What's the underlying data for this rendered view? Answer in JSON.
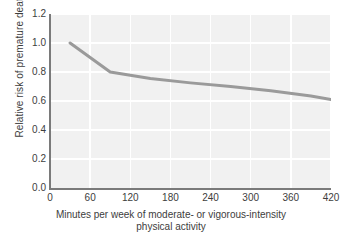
{
  "chart_data": {
    "type": "line",
    "title": "",
    "xlabel": "Minutes per week of moderate- or vigorous-intensity physical activity",
    "xlabel_line1": "Minutes per week of moderate- or vigorous-intensity",
    "xlabel_line2": "physical activity",
    "ylabel": "Relative risk of premature death",
    "xlim": [
      0,
      420
    ],
    "ylim": [
      0.0,
      1.2
    ],
    "xticks": [
      0,
      60,
      120,
      180,
      240,
      300,
      360,
      420
    ],
    "xtick_labels": [
      "0",
      "60",
      "120",
      "180",
      "240",
      "300",
      "360",
      "420"
    ],
    "yticks": [
      0.0,
      0.2,
      0.4,
      0.6,
      0.8,
      1.0,
      1.2
    ],
    "ytick_labels": [
      "0.0",
      "0.2",
      "0.4",
      "0.6",
      "0.8",
      "1.0",
      "1.2"
    ],
    "grid": true,
    "grid_color": "#ffffff",
    "plot_background": "#f1f1f1",
    "axis_color": "#7a7a7a",
    "legend": null,
    "series": [
      {
        "name": "Relative risk of premature death",
        "color": "#9a9a9a",
        "line_width": 3,
        "x": [
          30,
          90,
          150,
          210,
          270,
          330,
          390,
          420
        ],
        "y": [
          1.0,
          0.8,
          0.755,
          0.725,
          0.7,
          0.67,
          0.635,
          0.61
        ]
      }
    ]
  }
}
